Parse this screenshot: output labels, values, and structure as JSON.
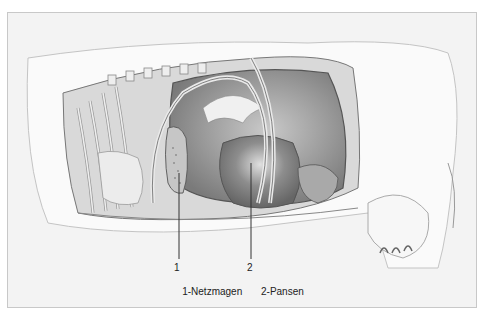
{
  "figure": {
    "labels": [
      {
        "number": "1",
        "name": "Netzmagen"
      },
      {
        "number": "2",
        "name": "Pansen"
      }
    ],
    "legend": {
      "item1": "1-Netzmagen",
      "item2": "2-Pansen"
    },
    "colors": {
      "background": "#ffffff",
      "frame_fill": "#f3f3f3",
      "frame_border": "#c8c8c8",
      "pencil_dark": "#555555",
      "pencil_mid": "#8a8a8a",
      "pencil_light": "#bdbdbd"
    }
  }
}
